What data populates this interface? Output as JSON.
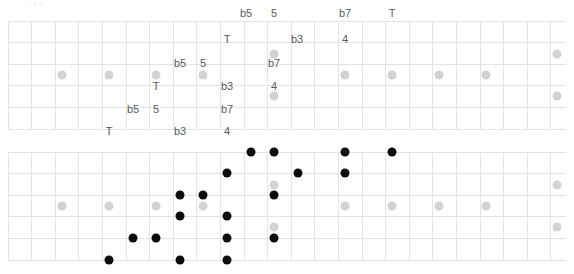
{
  "page": {
    "kind": "guitar-fretboard-diagrams",
    "width": 574,
    "height": 274,
    "clipped_caption": ". , ."
  },
  "style": {
    "background": "#ffffff",
    "grid_line_color": "#e3e3e6",
    "label_color": "#555c63",
    "inlay_dot_color": "#d2d2d2",
    "note_dot_color": "#0d0d0d",
    "label_font_size": 11
  },
  "geometry": {
    "fret_x": [
      8,
      31.6,
      55.2,
      78.8,
      102.4,
      126,
      149.6,
      173.2,
      196.8,
      220.4,
      244,
      267.6
    ],
    "string_y_top": [
      21,
      42.6,
      64.2,
      85.8,
      107.4,
      129
    ],
    "string_y_bottom": [
      152,
      173.6,
      195.2,
      216.8,
      238.4,
      260
    ],
    "strings": 6,
    "frets": 11
  },
  "legend": {
    "intervals": [
      "T",
      "b3",
      "4",
      "b5",
      "5",
      "b7"
    ],
    "root_symbol": "T",
    "flat_third": "b3",
    "fourth": "4",
    "flat_fifth": "b5",
    "fifth": "5",
    "flat_seventh": "b7"
  },
  "diagram_top": {
    "name": "interval-map-fretboard",
    "labels": [
      {
        "text": "b5",
        "x": 246,
        "y": 13
      },
      {
        "text": "5",
        "x": 274,
        "y": 13
      },
      {
        "text": "b7",
        "x": 345,
        "y": 13
      },
      {
        "text": "T",
        "x": 392,
        "y": 13
      },
      {
        "text": "T",
        "x": 227,
        "y": 39
      },
      {
        "text": "b3",
        "x": 297,
        "y": 39
      },
      {
        "text": "4",
        "x": 345,
        "y": 39
      },
      {
        "text": "b5",
        "x": 180,
        "y": 63
      },
      {
        "text": "5",
        "x": 203,
        "y": 63
      },
      {
        "text": "b7",
        "x": 274,
        "y": 63
      },
      {
        "text": "T",
        "x": 156,
        "y": 86
      },
      {
        "text": "b3",
        "x": 227,
        "y": 86
      },
      {
        "text": "4",
        "x": 274,
        "y": 86
      },
      {
        "text": "b5",
        "x": 133,
        "y": 109
      },
      {
        "text": "5",
        "x": 156,
        "y": 109
      },
      {
        "text": "b7",
        "x": 227,
        "y": 109
      },
      {
        "text": "T",
        "x": 109,
        "y": 131
      },
      {
        "text": "b3",
        "x": 180,
        "y": 131
      },
      {
        "text": "4",
        "x": 227,
        "y": 131
      }
    ],
    "inlays": [
      {
        "x": 62,
        "y": 75
      },
      {
        "x": 109,
        "y": 75
      },
      {
        "x": 156,
        "y": 75
      },
      {
        "x": 203,
        "y": 75
      },
      {
        "x": 274,
        "y": 54
      },
      {
        "x": 274,
        "y": 96
      },
      {
        "x": 345,
        "y": 75
      },
      {
        "x": 392,
        "y": 75
      },
      {
        "x": 439,
        "y": 75
      },
      {
        "x": 486,
        "y": 75
      },
      {
        "x": 557,
        "y": 54
      },
      {
        "x": 557,
        "y": 96
      }
    ]
  },
  "diagram_bottom": {
    "name": "scale-shape-fretboard",
    "inlays": [
      {
        "x": 62,
        "y": 206
      },
      {
        "x": 109,
        "y": 206
      },
      {
        "x": 156,
        "y": 206
      },
      {
        "x": 203,
        "y": 206
      },
      {
        "x": 274,
        "y": 185
      },
      {
        "x": 274,
        "y": 227
      },
      {
        "x": 345,
        "y": 206
      },
      {
        "x": 392,
        "y": 206
      },
      {
        "x": 439,
        "y": 206
      },
      {
        "x": 486,
        "y": 206
      },
      {
        "x": 557,
        "y": 185
      },
      {
        "x": 557,
        "y": 227
      }
    ],
    "notes": [
      {
        "x": 109,
        "y": 260
      },
      {
        "x": 133,
        "y": 238
      },
      {
        "x": 156,
        "y": 238
      },
      {
        "x": 180,
        "y": 216
      },
      {
        "x": 180,
        "y": 195
      },
      {
        "x": 180,
        "y": 260
      },
      {
        "x": 203,
        "y": 195
      },
      {
        "x": 227,
        "y": 173
      },
      {
        "x": 227,
        "y": 216
      },
      {
        "x": 227,
        "y": 238
      },
      {
        "x": 227,
        "y": 260
      },
      {
        "x": 251,
        "y": 152
      },
      {
        "x": 274,
        "y": 152
      },
      {
        "x": 274,
        "y": 195
      },
      {
        "x": 274,
        "y": 238
      },
      {
        "x": 298,
        "y": 173
      },
      {
        "x": 345,
        "y": 152
      },
      {
        "x": 345,
        "y": 173
      },
      {
        "x": 392,
        "y": 152
      }
    ]
  }
}
